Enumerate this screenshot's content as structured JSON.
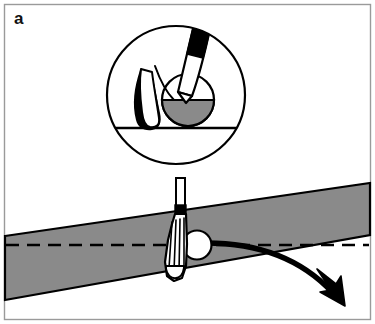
{
  "figure": {
    "panel_label": "a",
    "caption_text": "",
    "type": "line-art-diagram",
    "width": 375,
    "height": 324
  },
  "colors": {
    "background": "#ffffff",
    "ink": "#000000",
    "slope_fill": "#8a8a8a",
    "ball_fill": "#ffffff",
    "ground_fill": "#8a8a8a",
    "frame_border": "#9a9a9a",
    "label_color": "#111111"
  },
  "frame": {
    "border_width": 1,
    "inset": 4
  },
  "inset_detail": {
    "name": "magnified-impact-circle",
    "circle": {
      "cx": 176,
      "cy": 95,
      "r": 70,
      "stroke_width": 2
    },
    "ball": {
      "cx": 188,
      "cy": 100,
      "r": 26,
      "upper_fill": "#ffffff",
      "lower_fill": "#8a8a8a"
    },
    "ground_line": {
      "y": 128,
      "x1": 110,
      "x2": 243,
      "stroke_width": 2
    },
    "club": {
      "name": "club-shaft-and-head",
      "angle_deg": 16,
      "ferrule_fill": "#000000",
      "shaft_fill": "#ffffff"
    },
    "grass_blade": {
      "name": "grass-blade",
      "fill": "#ffffff",
      "shadow_fill": "#000000"
    }
  },
  "main_scene": {
    "slope_band": {
      "name": "sloped-ground-band",
      "fill": "#8a8a8a",
      "stroke_width": 2,
      "top_left_y": 236,
      "top_right_y": 183,
      "bottom_left_y": 300,
      "bottom_right_y": 235,
      "left_x": 5,
      "right_x": 370
    },
    "horizontal_reference": {
      "name": "horizontal-dashed-reference-line",
      "y": 245,
      "x1": 6,
      "x2": 369,
      "dash": "12 8",
      "stroke_width": 2.4
    },
    "ball": {
      "name": "golf-ball",
      "cx": 197,
      "cy": 245,
      "r": 14,
      "fill": "#ffffff",
      "stroke_width": 2
    },
    "club": {
      "name": "golf-club",
      "shaft_top_y": 178,
      "shaft_x": 180,
      "shaft_width": 9,
      "ferrule_top_y": 205,
      "ferrule_bottom_y": 214,
      "head_bottom_y": 281,
      "groove_count": 5
    },
    "trajectory_arrow": {
      "name": "ball-trajectory-arrow",
      "start_x": 208,
      "start_y": 243,
      "end_x": 345,
      "end_y": 303,
      "stroke_width": 5,
      "direction": "down-right"
    }
  }
}
